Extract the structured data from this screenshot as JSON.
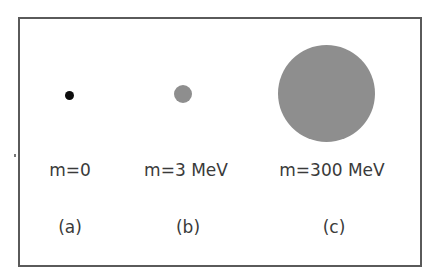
{
  "figure": {
    "panels": [
      {
        "id": "a",
        "mass_label": "m=0",
        "caption": "(a)",
        "circle": {
          "cx": 69,
          "cy": 95,
          "r": 4.5,
          "color": "#0d0d0d"
        }
      },
      {
        "id": "b",
        "mass_label": "m=3 MeV",
        "caption": "(b)",
        "circle": {
          "cx": 183,
          "cy": 94,
          "r": 9,
          "color": "#8e8e8e"
        }
      },
      {
        "id": "c",
        "mass_label": "m=300 MeV",
        "caption": "(c)",
        "circle": {
          "cx": 326,
          "cy": 93,
          "r": 48.5,
          "color": "#8e8e8e"
        }
      }
    ],
    "colors": {
      "border": "#5a5a5a",
      "text": "#3a3a3a",
      "background": "#ffffff"
    }
  }
}
